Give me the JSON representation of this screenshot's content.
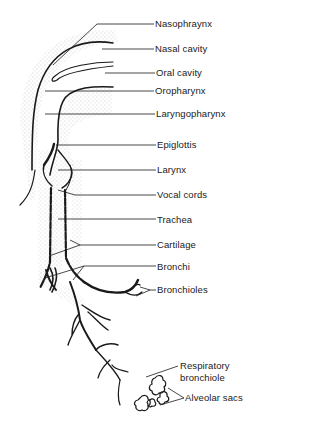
{
  "diagram": {
    "colors": {
      "ink": "#1a1a1a",
      "stipple": "#6f6f6f",
      "background": "#ffffff"
    },
    "labels": [
      {
        "id": "nasopharynx",
        "text": "Nasophraynx",
        "x": 155,
        "y": 18
      },
      {
        "id": "nasal-cavity",
        "text": "Nasal cavity",
        "x": 155,
        "y": 43
      },
      {
        "id": "oral-cavity",
        "text": "Oral cavity",
        "x": 156,
        "y": 67
      },
      {
        "id": "oropharynx",
        "text": "Oropharynx",
        "x": 155,
        "y": 85
      },
      {
        "id": "laryngopharynx",
        "text": "Laryngopharynx",
        "x": 156,
        "y": 108
      },
      {
        "id": "epiglottis",
        "text": "Epiglottis",
        "x": 157,
        "y": 139
      },
      {
        "id": "larynx",
        "text": "Larynx",
        "x": 157,
        "y": 164
      },
      {
        "id": "vocal-cords",
        "text": "Vocal cords",
        "x": 157,
        "y": 189
      },
      {
        "id": "trachea",
        "text": "Trachea",
        "x": 157,
        "y": 214
      },
      {
        "id": "cartilage",
        "text": "Cartilage",
        "x": 157,
        "y": 239
      },
      {
        "id": "bronchi",
        "text": "Bronchi",
        "x": 157,
        "y": 261
      },
      {
        "id": "bronchioles",
        "text": "Bronchioles",
        "x": 157,
        "y": 284
      },
      {
        "id": "respiratory-bronchiole-1",
        "text": "Respiratory",
        "x": 180,
        "y": 360
      },
      {
        "id": "respiratory-bronchiole-2",
        "text": "bronchiole",
        "x": 180,
        "y": 372
      },
      {
        "id": "alveolar-sacs",
        "text": "Alveolar sacs",
        "x": 185,
        "y": 392
      }
    ]
  }
}
